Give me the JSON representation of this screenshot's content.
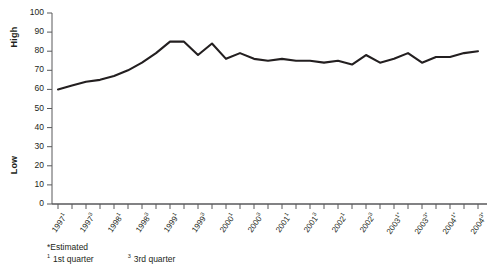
{
  "chart_data": {
    "type": "line",
    "title": "",
    "xlabel": "",
    "ylabel": "High / Low",
    "ylim": [
      0,
      100
    ],
    "ytick_step": 10,
    "grid": false,
    "legend": "none",
    "axis_titles": {
      "high": "High",
      "low": "Low"
    },
    "ytick_labels": [
      "100",
      "90",
      "80",
      "70",
      "60",
      "50",
      "40",
      "30",
      "20",
      "10",
      "0"
    ],
    "categories": [
      "1997¹",
      "1997²",
      "1997³",
      "1997⁴",
      "1998¹",
      "1998²",
      "1998³",
      "1998⁴",
      "1999¹",
      "1999²",
      "1999³",
      "1999⁴",
      "2000¹",
      "2000²",
      "2000³",
      "2000⁴",
      "2001¹",
      "2001²",
      "2001³",
      "2001⁴",
      "2002¹",
      "2002²",
      "2002³",
      "2002⁴",
      "2003¹*",
      "2003²*",
      "2003³*",
      "2003⁴*",
      "2004¹*",
      "2004²*",
      "2004³*"
    ],
    "values": [
      60,
      62,
      64,
      65,
      67,
      70,
      74,
      79,
      85,
      85,
      78,
      84,
      76,
      79,
      76,
      75,
      76,
      75,
      75,
      74,
      75,
      73,
      78,
      74,
      76,
      79,
      74,
      77,
      77,
      79,
      80
    ],
    "xtick_labels": [
      {
        "year": "1997",
        "quarter": "1",
        "estimated": false
      },
      {
        "year": "1997",
        "quarter": "3",
        "estimated": false
      },
      {
        "year": "1998",
        "quarter": "1",
        "estimated": false
      },
      {
        "year": "1998",
        "quarter": "3",
        "estimated": false
      },
      {
        "year": "1999",
        "quarter": "1",
        "estimated": false
      },
      {
        "year": "1999",
        "quarter": "3",
        "estimated": false
      },
      {
        "year": "2000",
        "quarter": "1",
        "estimated": false
      },
      {
        "year": "2000",
        "quarter": "3",
        "estimated": false
      },
      {
        "year": "2001",
        "quarter": "1",
        "estimated": false
      },
      {
        "year": "2001",
        "quarter": "3",
        "estimated": false
      },
      {
        "year": "2002",
        "quarter": "1",
        "estimated": false
      },
      {
        "year": "2002",
        "quarter": "3",
        "estimated": false
      },
      {
        "year": "2003",
        "quarter": "1",
        "estimated": true
      },
      {
        "year": "2003",
        "quarter": "3",
        "estimated": true
      },
      {
        "year": "2004",
        "quarter": "1",
        "estimated": true
      },
      {
        "year": "2004",
        "quarter": "3",
        "estimated": true
      }
    ],
    "series_color": "#231f20"
  },
  "footnotes": {
    "estimated": "*Estimated",
    "q1_marker": "1",
    "q1_text": "1st quarter",
    "q3_marker": "3",
    "q3_text": "3rd quarter"
  }
}
